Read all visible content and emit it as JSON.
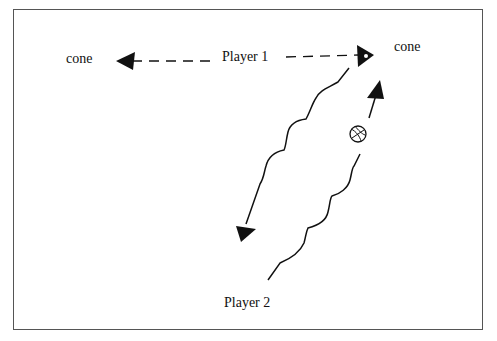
{
  "diagram": {
    "labels": {
      "cone_left": "cone",
      "cone_right": "cone",
      "player1": "Player 1",
      "player2": "Player 2"
    },
    "elements": [
      {
        "type": "dashed-arrow",
        "from": "Player 1",
        "to": "cone (left)"
      },
      {
        "type": "dashed-arrow",
        "from": "Player 1",
        "to": "cone (right)"
      },
      {
        "type": "wavy-arrow",
        "description": "Player 1 dribble path down-left toward Player 2 area"
      },
      {
        "type": "wavy-line-with-arrow",
        "description": "Player 2 dribble path up-right with ball"
      },
      {
        "type": "ball-icon",
        "description": "basketball"
      }
    ],
    "colors": {
      "stroke": "#111111",
      "border": "#555555",
      "background": "#ffffff"
    }
  }
}
